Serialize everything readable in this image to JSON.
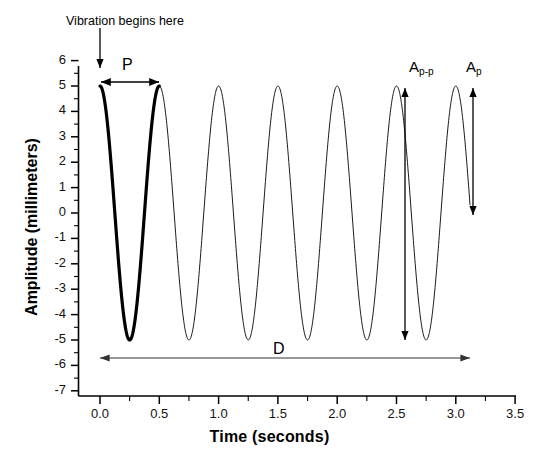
{
  "chart_data": {
    "type": "line",
    "title": "",
    "xlabel": "Time (seconds)",
    "ylabel": "Amplitude (millimeters)",
    "xlim": [
      -0.19,
      3.5
    ],
    "ylim": [
      -7,
      6
    ],
    "xticks": [
      "0.0",
      "0.5",
      "1.0",
      "1.5",
      "2.0",
      "2.5",
      "3.0",
      "3.5"
    ],
    "xtick_values": [
      0.0,
      0.5,
      1.0,
      1.5,
      2.0,
      2.5,
      3.0,
      3.5
    ],
    "xtick_minor_step": 0.25,
    "yticks": [
      "6",
      "5",
      "4",
      "3",
      "2",
      "1",
      "0",
      "-1",
      "-2",
      "-3",
      "-4",
      "-5",
      "-6",
      "-7"
    ],
    "ytick_values": [
      6,
      5,
      4,
      3,
      2,
      1,
      0,
      -1,
      -2,
      -3,
      -4,
      -5,
      -6,
      -7
    ],
    "ytick_minor_step": 0.5,
    "grid": false,
    "legend": "none",
    "series": [
      {
        "name": "vibration waveform (first period, highlighted)",
        "style": "bold",
        "color": "#000000",
        "linewidth": 3.2,
        "waveform": "cosine",
        "amplitude": 5,
        "period": 0.5,
        "phase": 0,
        "x_start": 0.0,
        "x_end": 0.5
      },
      {
        "name": "vibration waveform (remaining periods)",
        "style": "thin",
        "color": "#000000",
        "linewidth": 0.9,
        "waveform": "cosine",
        "amplitude": 5,
        "period": 0.5,
        "phase": 0,
        "x_start": 0.5,
        "x_end": 3.12
      }
    ],
    "annotations": [
      {
        "name": "vibration-begins",
        "text": "Vibration begins here",
        "arrow": "down",
        "points_to_x": 0.0,
        "points_to_y": 5.6
      },
      {
        "name": "period-marker",
        "text": "P",
        "arrow": "double-horizontal",
        "x_from": 0.0,
        "x_to": 0.5,
        "y": 5.45
      },
      {
        "name": "duration-marker",
        "text": "D",
        "arrow": "double-horizontal",
        "x_from": 0.0,
        "x_to": 3.12,
        "y": -6.0
      },
      {
        "name": "peak-to-peak-amplitude",
        "text": "A",
        "subscript": "p-p",
        "arrow": "double-vertical",
        "x": 2.75,
        "y_from": 5.0,
        "y_to": -5.0
      },
      {
        "name": "peak-amplitude",
        "text": "A",
        "subscript": "p",
        "arrow": "double-vertical",
        "x": 3.12,
        "y_from": 5.0,
        "y_to": 0.0
      }
    ]
  },
  "colors": {
    "axis": "#000000",
    "waveform": "#000000",
    "annotation_arrow": "#333333",
    "background": "#ffffff"
  }
}
